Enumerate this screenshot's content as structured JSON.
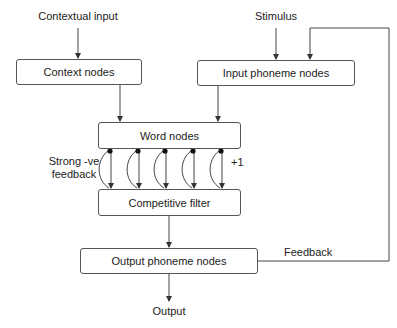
{
  "diagram": {
    "inputs": {
      "contextual_input": "Contextual input",
      "stimulus": "Stimulus"
    },
    "nodes": {
      "context_nodes": "Context nodes",
      "input_phoneme_nodes": "Input phoneme nodes",
      "word_nodes": "Word nodes",
      "competitive_filter": "Competitive filter",
      "output_phoneme_nodes": "Output phoneme nodes"
    },
    "annotations": {
      "strong_negative_feedback_line1": "Strong -ve",
      "strong_negative_feedback_line2": "feedback",
      "plus_one": "+1",
      "feedback": "Feedback"
    },
    "outputs": {
      "output": "Output"
    },
    "colors": {
      "line": "#444444",
      "box_border": "#555555",
      "text": "#222222",
      "background": "#ffffff"
    },
    "word_to_filter_connections": 5
  }
}
